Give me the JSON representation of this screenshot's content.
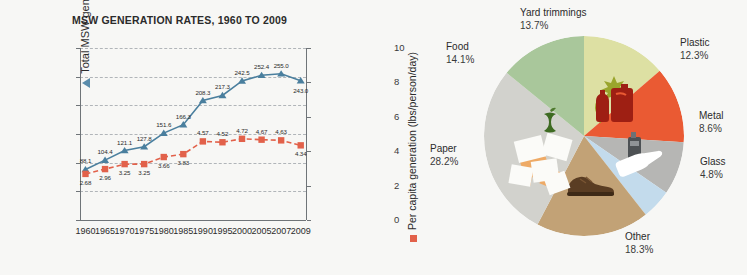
{
  "chart_data": [
    {
      "type": "line",
      "title": "MSW GENERATION RATES, 1960 TO 2009",
      "xlabel": "",
      "ylabel": "Total MSW generation (million tons)",
      "y2label": "Per capita generation (lbs/person/day)",
      "categories": [
        "1960",
        "1965",
        "1970",
        "1975",
        "1980",
        "1985",
        "1990",
        "1995",
        "2000",
        "2005",
        "2007",
        "2009"
      ],
      "ylim": [
        0,
        300
      ],
      "yticks": [
        "0",
        "50",
        "100",
        "150",
        "200",
        "250",
        "300"
      ],
      "y2lim": [
        0,
        10
      ],
      "y2ticks": [
        "0",
        "2",
        "4",
        "6",
        "8",
        "10"
      ],
      "grid": true,
      "legend_position": "axis-titles",
      "series": [
        {
          "name": "Total MSW generation (million tons)",
          "axis": "left",
          "color": "#4a7f9e",
          "marker": "triangle",
          "values": [
            88.1,
            104.4,
            121.1,
            127.8,
            151.6,
            166.3,
            208.3,
            217.3,
            242.5,
            252.4,
            255.0,
            243.0
          ],
          "labels": [
            "88.1",
            "104.4",
            "121.1",
            "127.8",
            "151.6",
            "166.3",
            "208.3",
            "217.3",
            "242.5",
            "252.4",
            "255.0",
            "243.0"
          ]
        },
        {
          "name": "Per capita generation (lbs/person/day)",
          "axis": "right",
          "color": "#e2614a",
          "marker": "square",
          "values": [
            2.68,
            2.96,
            3.25,
            3.25,
            3.66,
            3.83,
            4.57,
            4.52,
            4.72,
            4.67,
            4.63,
            4.34
          ],
          "labels": [
            "2.68",
            "2.96",
            "3.25",
            "3.25",
            "3.66",
            "3.83",
            "4.57",
            "4.52",
            "4.72",
            "4.67",
            "4.63",
            "4.34"
          ]
        }
      ]
    },
    {
      "type": "pie",
      "title": "",
      "slices": [
        {
          "label": "Paper",
          "pct": 28.2,
          "pct_text": "28.2%",
          "color": "#d2d2cd",
          "icon": "paper-sheets-icon"
        },
        {
          "label": "Food",
          "pct": 14.1,
          "pct_text": "14.1%",
          "color": "#a9c79b",
          "icon": "apple-core-icon"
        },
        {
          "label": "Yard trimmings",
          "pct": 13.7,
          "pct_text": "13.7%",
          "color": "#dde0a3",
          "icon": "leaves-icon"
        },
        {
          "label": "Plastic",
          "pct": 12.3,
          "pct_text": "12.3%",
          "color": "#ea5a33",
          "icon": "plastic-bottles-icon"
        },
        {
          "label": "Metal",
          "pct": 8.6,
          "pct_text": "8.6%",
          "color": "#b6b6b4",
          "icon": "metal-can-icon"
        },
        {
          "label": "Glass",
          "pct": 4.8,
          "pct_text": "4.8%",
          "color": "#c3dbec",
          "icon": "glass-bottle-icon"
        },
        {
          "label": "Other",
          "pct": 18.3,
          "pct_text": "18.3%",
          "color": "#c2a276",
          "icon": "shoe-icon"
        }
      ]
    }
  ],
  "line_chart": {
    "title": "MSW GENERATION RATES, 1960 TO 2009",
    "ylabel_left": "Total MSW generation (million tons)",
    "ylabel_right": "Per capita generation (lbs/person/day)",
    "yticks_left": [
      "300",
      "250",
      "200",
      "150",
      "100",
      "50",
      "0"
    ],
    "yticks_right": [
      "10",
      "8",
      "6",
      "4",
      "2",
      "0"
    ],
    "xticks": [
      "1960",
      "1965",
      "1970",
      "1975",
      "1980",
      "1985",
      "1990",
      "1995",
      "2000",
      "2005",
      "2007",
      "2009"
    ]
  },
  "pie_chart": {
    "labels": [
      {
        "name": "Yard trimmings",
        "pct": "13.7%"
      },
      {
        "name": "Plastic",
        "pct": "12.3%"
      },
      {
        "name": "Metal",
        "pct": "8.6%"
      },
      {
        "name": "Glass",
        "pct": "4.8%"
      },
      {
        "name": "Other",
        "pct": "18.3%"
      },
      {
        "name": "Paper",
        "pct": "28.2%"
      },
      {
        "name": "Food",
        "pct": "14.1%"
      }
    ]
  },
  "colors": {
    "series_blue": "#4a7f9e",
    "series_red": "#e2614a",
    "background": "#f7f7f5",
    "axis": "#6f7478"
  }
}
